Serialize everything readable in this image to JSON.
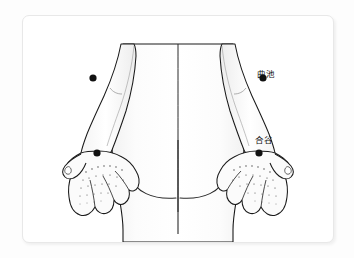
{
  "illustration": {
    "title": "Acupuncture point chart — posterior upper body",
    "view": "posterior",
    "background_color": "#fdfdfd",
    "card_color": "#ffffff",
    "card_border_color": "#e8e8e8",
    "body_fill_color": "#fbfbfb",
    "body_outline_color": "#1a1a1a",
    "marker_color": "#111111",
    "label_color": "#111111"
  },
  "points": [
    {
      "id": "quchi-right",
      "label": "曲池",
      "marker": "acupoint-dot",
      "side": "right",
      "region": "elbow",
      "labeled": true
    },
    {
      "id": "hegu-right",
      "label": "合谷",
      "marker": "acupoint-dot",
      "side": "right",
      "region": "hand",
      "labeled": true
    },
    {
      "id": "quchi-left",
      "label": "",
      "marker": "acupoint-dot",
      "side": "left",
      "region": "elbow",
      "labeled": false
    },
    {
      "id": "hegu-left",
      "label": "",
      "marker": "acupoint-dot",
      "side": "left",
      "region": "hand",
      "labeled": false
    }
  ]
}
